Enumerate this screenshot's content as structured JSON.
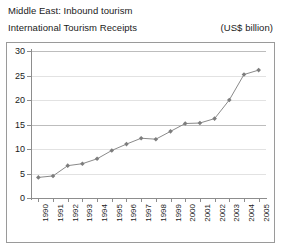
{
  "header": {
    "title_line_1": "Middle East: Inbound tourism",
    "title_line_2": "International Tourism Receipts",
    "units": "(US$ billion)"
  },
  "colors": {
    "series_line": "#8a8a8a",
    "marker": "#7d7d7d",
    "gridline": "#e2e2e2",
    "gridline_major": "#bdbdbd",
    "axis": "#8d8d8d",
    "frame": "#9a9a9a",
    "text": "#1a1a1a",
    "background": "#ffffff"
  },
  "chart_data": {
    "type": "line",
    "subtitle": "International Tourism Receipts",
    "xlabel": "",
    "ylabel": "(US$ billion)",
    "ylim": [
      0,
      30
    ],
    "yticks": [
      0,
      5,
      10,
      15,
      20,
      25,
      30
    ],
    "ytick_labels": [
      "0",
      "5",
      "10",
      "15",
      "20",
      "25",
      "30"
    ],
    "grid": true,
    "legend": false,
    "categories": [
      "1990",
      "1991",
      "1992",
      "1993",
      "1994",
      "1995",
      "1996",
      "1997",
      "1998",
      "1999",
      "2000",
      "2001",
      "2002",
      "2003",
      "2004",
      "2005"
    ],
    "values": [
      4.2,
      4.5,
      6.6,
      7.0,
      8.0,
      9.7,
      11.0,
      12.2,
      12.0,
      13.6,
      15.2,
      15.3,
      16.2,
      20.0,
      25.2,
      26.1
    ],
    "series": [
      {
        "name": "International Tourism Receipts",
        "marker": "diamond",
        "values": [
          4.2,
          4.5,
          6.6,
          7.0,
          8.0,
          9.7,
          11.0,
          12.2,
          12.0,
          13.6,
          15.2,
          15.3,
          16.2,
          20.0,
          25.2,
          26.1
        ]
      }
    ]
  }
}
